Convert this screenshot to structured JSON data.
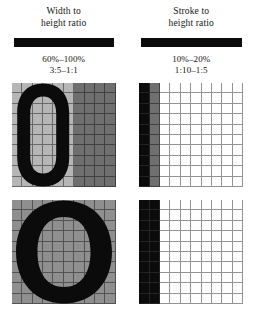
{
  "figure": {
    "background_color": "#ffffff",
    "ink_color": "#0b0b0b"
  },
  "columns": [
    {
      "id": "width-to-height",
      "heading_line1": "Width to",
      "heading_line2": "height ratio",
      "bar_label": "solid-rule-bar",
      "ratio_percent": "60%–100%",
      "ratio_proportion": "3:5–1:1",
      "diagrams": [
        {
          "id": "narrow-o",
          "caption_value": "60%",
          "glyph": "O",
          "grid_cols": 10,
          "grid_rows": 10,
          "glyph_span_cols": 6,
          "fill_colors": {
            "inside": "#b6b6b6",
            "outside": "#6f6f6f",
            "stroke": "#0b0b0b"
          }
        },
        {
          "id": "wide-o",
          "caption_value": "100%",
          "glyph": "O",
          "grid_cols": 10,
          "grid_rows": 10,
          "glyph_span_cols": 10,
          "fill_colors": {
            "inside": "#8f8f8f",
            "outside": "#8f8f8f",
            "stroke": "#0b0b0b"
          }
        }
      ]
    },
    {
      "id": "stroke-to-height",
      "heading_line1": "Stroke to",
      "heading_line2": "height ratio",
      "bar_label": "solid-rule-bar",
      "ratio_percent": "10%–20%",
      "ratio_proportion": "1:10–1:5",
      "diagrams": [
        {
          "id": "thin-stroke",
          "caption_value": "10%",
          "grid_cols": 10,
          "grid_rows": 10,
          "black_cols": 1,
          "gray_cols": 1,
          "white_cols": 8,
          "fill_colors": {
            "stroke": "#0b0b0b",
            "shade": "#6f6f6f",
            "empty": "#ffffff"
          }
        },
        {
          "id": "thick-stroke",
          "caption_value": "20%",
          "grid_cols": 10,
          "grid_rows": 10,
          "black_cols": 2,
          "gray_cols": 0,
          "white_cols": 8,
          "fill_colors": {
            "stroke": "#0b0b0b",
            "shade": "#6f6f6f",
            "empty": "#ffffff"
          }
        }
      ]
    }
  ],
  "chart_data": {
    "type": "table",
    "categories": [
      "Width to height ratio",
      "Stroke to height ratio"
    ],
    "series": [
      {
        "name": "Width to height ratio",
        "percent_range": "60%–100%",
        "proportion_range": "3:5–1:1",
        "values": [
          60,
          100
        ]
      },
      {
        "name": "Stroke to height ratio",
        "percent_range": "10%–20%",
        "proportion_range": "1:10–1:5",
        "values": [
          10,
          20
        ]
      }
    ],
    "grid": true,
    "xlabel": "",
    "ylabel": ""
  }
}
